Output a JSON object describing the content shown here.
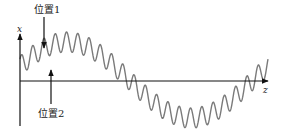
{
  "diagram": {
    "type": "wave-diagram",
    "axes": {
      "vertical_label": "x",
      "horizontal_label": "z"
    },
    "markers": [
      {
        "label": "位置1",
        "direction": "down",
        "x": 44
      },
      {
        "label": "位置2",
        "direction": "up",
        "x": 51
      }
    ],
    "wave": {
      "description": "low-frequency sinusoid with superimposed high-frequency ripple",
      "carrier_cycles": 1,
      "ripple_cycles": 22,
      "stroke_color": "#7a7a7a"
    },
    "colors": {
      "axis": "#111111",
      "wave": "#7a7a7a",
      "text": "#222222"
    }
  }
}
